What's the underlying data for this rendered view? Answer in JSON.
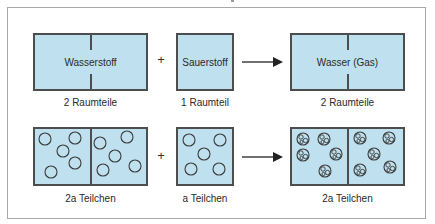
{
  "diagram": {
    "top_row": {
      "reactant1": {
        "label": "Wasserstoff",
        "caption": "2 Raumteile"
      },
      "operator": "+",
      "reactant2": {
        "label": "Sauerstoff",
        "caption": "1 Raumteil"
      },
      "arrow": "→",
      "product": {
        "label": "Wasser (Gas)",
        "caption": "2 Raumteile"
      }
    },
    "bottom_row": {
      "reactant1": {
        "caption": "2a Teilchen",
        "particles": 10
      },
      "operator": "+",
      "reactant2": {
        "caption": "a Teilchen",
        "particles": 5
      },
      "arrow": "→",
      "product": {
        "caption": "2a Teilchen",
        "particles": 10
      }
    },
    "colors": {
      "box_fill": "#bfe0ee",
      "box_border": "#4d4d4d",
      "frame_border": "#a8a8a8"
    }
  }
}
